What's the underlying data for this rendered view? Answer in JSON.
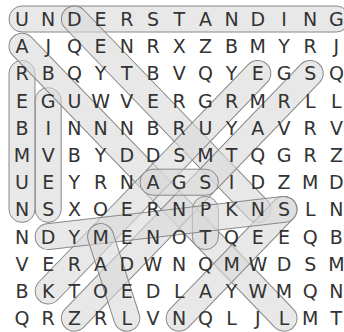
{
  "puzzle": {
    "rows": 12,
    "cols": 13,
    "grid": [
      [
        "U",
        "N",
        "D",
        "E",
        "R",
        "S",
        "T",
        "A",
        "N",
        "D",
        "I",
        "N",
        "G"
      ],
      [
        "A",
        "J",
        "Q",
        "E",
        "N",
        "R",
        "X",
        "Z",
        "B",
        "M",
        "Y",
        "R",
        "J"
      ],
      [
        "R",
        "B",
        "Q",
        "Y",
        "T",
        "B",
        "V",
        "Q",
        "Y",
        "E",
        "G",
        "S",
        "Q"
      ],
      [
        "E",
        "G",
        "U",
        "W",
        "V",
        "E",
        "R",
        "G",
        "R",
        "M",
        "R",
        "L",
        "L"
      ],
      [
        "B",
        "I",
        "N",
        "N",
        "N",
        "B",
        "R",
        "U",
        "Y",
        "A",
        "V",
        "R",
        "V"
      ],
      [
        "M",
        "V",
        "B",
        "Y",
        "D",
        "D",
        "S",
        "M",
        "T",
        "Q",
        "G",
        "R",
        "Z"
      ],
      [
        "U",
        "E",
        "Y",
        "R",
        "N",
        "A",
        "G",
        "S",
        "I",
        "D",
        "Z",
        "M",
        "D"
      ],
      [
        "N",
        "S",
        "X",
        "O",
        "E",
        "R",
        "N",
        "P",
        "K",
        "N",
        "S",
        "L",
        "N"
      ],
      [
        "N",
        "D",
        "Y",
        "M",
        "E",
        "N",
        "O",
        "T",
        "Q",
        "E",
        "E",
        "Q",
        "B"
      ],
      [
        "V",
        "E",
        "R",
        "A",
        "D",
        "W",
        "N",
        "Q",
        "M",
        "W",
        "D",
        "S",
        "M"
      ],
      [
        "B",
        "K",
        "T",
        "O",
        "E",
        "D",
        "L",
        "A",
        "Y",
        "W",
        "M",
        "Q",
        "N"
      ],
      [
        "Q",
        "R",
        "Z",
        "R",
        "L",
        "V",
        "N",
        "Q",
        "L",
        "J",
        "L",
        "M",
        "T"
      ]
    ],
    "found_words": [
      {
        "word": "UNDERSTANDING",
        "start": [
          0,
          0
        ],
        "end": [
          0,
          12
        ]
      },
      {
        "word": "REBMUN",
        "start": [
          2,
          0
        ],
        "end": [
          7,
          0
        ]
      },
      {
        "word": "GIVES",
        "start": [
          3,
          1
        ],
        "end": [
          7,
          1
        ]
      },
      {
        "word": "DETAILED",
        "start": [
          0,
          2
        ],
        "end": [
          7,
          9
        ]
      },
      {
        "word": "AB...",
        "start": [
          1,
          0
        ],
        "end": [
          11,
          10
        ]
      },
      {
        "word": "EGR diag",
        "start": [
          2,
          9
        ],
        "end": [
          10,
          1
        ]
      },
      {
        "word": "S diag",
        "start": [
          2,
          11
        ],
        "end": [
          11,
          2
        ]
      },
      {
        "word": "GAS",
        "start": [
          6,
          7
        ],
        "end": [
          6,
          5
        ]
      },
      {
        "word": "PT",
        "start": [
          7,
          7
        ],
        "end": [
          8,
          7
        ]
      },
      {
        "word": "NS diag",
        "start": [
          11,
          6
        ],
        "end": [
          7,
          10
        ]
      },
      {
        "word": "DES",
        "start": [
          8,
          1
        ],
        "end": [
          7,
          10
        ]
      },
      {
        "word": "MTOE",
        "start": [
          8,
          3
        ],
        "end": [
          11,
          4
        ]
      }
    ]
  },
  "colors": {
    "highlight_fill": "#d9d9d9",
    "highlight_stroke": "#888888",
    "letter": "#333333",
    "background": "#ffffff"
  }
}
